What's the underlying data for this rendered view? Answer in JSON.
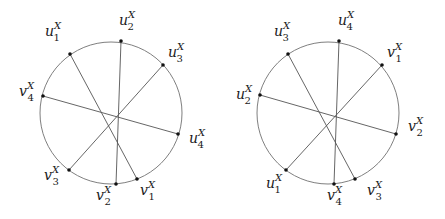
{
  "figure": {
    "colors": {
      "circle": "#707070",
      "chord": "#555555",
      "point": "#111111",
      "label": "#1a1a1a"
    }
  },
  "diagrams": [
    {
      "id": "left",
      "center": [
        111,
        113
      ],
      "radius": 71,
      "points": [
        {
          "id": "u1",
          "base": "u",
          "sub": "1",
          "sup": "X",
          "xy": [
            70,
            54
          ],
          "label_xy": [
            45,
            36
          ]
        },
        {
          "id": "u2",
          "base": "u",
          "sub": "2",
          "sup": "X",
          "xy": [
            121,
            41
          ],
          "label_xy": [
            119,
            25
          ]
        },
        {
          "id": "u3",
          "base": "u",
          "sub": "3",
          "sup": "X",
          "xy": [
            163,
            65
          ],
          "label_xy": [
            168,
            57
          ]
        },
        {
          "id": "u4",
          "base": "u",
          "sub": "4",
          "sup": "X",
          "xy": [
            178,
            134
          ],
          "label_xy": [
            189,
            143
          ]
        },
        {
          "id": "v1",
          "base": "v",
          "sub": "1",
          "sup": "X",
          "xy": [
            137,
            179
          ],
          "label_xy": [
            140,
            195
          ]
        },
        {
          "id": "v2",
          "base": "v",
          "sub": "2",
          "sup": "X",
          "xy": [
            116,
            184
          ],
          "label_xy": [
            96,
            200
          ]
        },
        {
          "id": "v3",
          "base": "v",
          "sub": "3",
          "sup": "X",
          "xy": [
            69,
            170
          ],
          "label_xy": [
            44,
            180
          ]
        },
        {
          "id": "v4",
          "base": "v",
          "sub": "4",
          "sup": "X",
          "xy": [
            43,
            96
          ],
          "label_xy": [
            19,
            96
          ]
        }
      ],
      "chords": [
        [
          "u1",
          "v1"
        ],
        [
          "u2",
          "v2"
        ],
        [
          "u3",
          "v3"
        ],
        [
          "v4",
          "u4"
        ]
      ]
    },
    {
      "id": "right",
      "center": [
        328,
        113
      ],
      "radius": 71,
      "points": [
        {
          "id": "u3",
          "base": "u",
          "sub": "3",
          "sup": "X",
          "xy": [
            288,
            54
          ],
          "label_xy": [
            274,
            36
          ]
        },
        {
          "id": "u4",
          "base": "u",
          "sub": "4",
          "sup": "X",
          "xy": [
            339,
            41
          ],
          "label_xy": [
            338,
            25
          ]
        },
        {
          "id": "v1",
          "base": "v",
          "sub": "1",
          "sup": "X",
          "xy": [
            382,
            65
          ],
          "label_xy": [
            387,
            57
          ]
        },
        {
          "id": "v2",
          "base": "v",
          "sub": "2",
          "sup": "X",
          "xy": [
            396,
            134
          ],
          "label_xy": [
            408,
            131
          ]
        },
        {
          "id": "v3",
          "base": "v",
          "sub": "3",
          "sup": "X",
          "xy": [
            355,
            179
          ],
          "label_xy": [
            367,
            195
          ]
        },
        {
          "id": "v4",
          "base": "v",
          "sub": "4",
          "sup": "X",
          "xy": [
            334,
            184
          ],
          "label_xy": [
            327,
            200
          ]
        },
        {
          "id": "u1",
          "base": "u",
          "sub": "1",
          "sup": "X",
          "xy": [
            286,
            170
          ],
          "label_xy": [
            266,
            188
          ]
        },
        {
          "id": "u2",
          "base": "u",
          "sub": "2",
          "sup": "X",
          "xy": [
            260,
            95
          ],
          "label_xy": [
            236,
            99
          ]
        }
      ],
      "chords": [
        [
          "u3",
          "v3"
        ],
        [
          "u4",
          "v4"
        ],
        [
          "v1",
          "u1"
        ],
        [
          "u2",
          "v2"
        ]
      ]
    }
  ]
}
